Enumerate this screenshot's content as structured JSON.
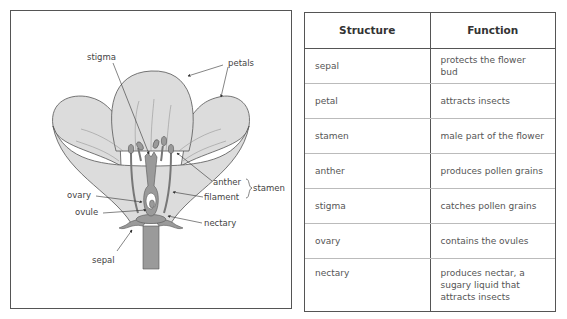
{
  "diagram": {
    "labels": {
      "stigma": "stigma",
      "petals": "petals",
      "anther": "anther",
      "filament": "filament",
      "stamen": "stamen",
      "ovary": "ovary",
      "ovule": "ovule",
      "nectary": "nectary",
      "sepal": "sepal"
    },
    "colors": {
      "petal_fill": "#dcdcdc",
      "organ_fill": "#9a9a9a",
      "outline": "#555555"
    }
  },
  "table": {
    "headers": [
      "Structure",
      "Function"
    ],
    "rows": [
      {
        "structure": "sepal",
        "function": "protects the flower bud"
      },
      {
        "structure": "petal",
        "function": "attracts insects"
      },
      {
        "structure": "stamen",
        "function": "male part of the flower"
      },
      {
        "structure": "anther",
        "function": "produces pollen grains"
      },
      {
        "structure": "stigma",
        "function": "catches pollen grains"
      },
      {
        "structure": "ovary",
        "function": "contains the ovules"
      },
      {
        "structure": "nectary",
        "function": "produces nectar, a sugary liquid that attracts insects"
      }
    ]
  }
}
